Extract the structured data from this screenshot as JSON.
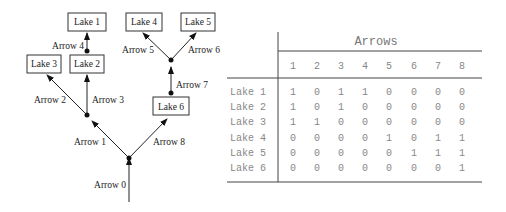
{
  "diagram": {
    "lakes": [
      "Lake 1",
      "Lake 2",
      "Lake 3",
      "Lake 4",
      "Lake 5",
      "Lake 6"
    ],
    "arrows": [
      "Arrow 0",
      "Arrow 1",
      "Arrow 2",
      "Arrow 3",
      "Arrow 4",
      "Arrow 5",
      "Arrow 6",
      "Arrow 7",
      "Arrow 8"
    ]
  },
  "table": {
    "title": "Arrows",
    "columns": [
      "1",
      "2",
      "3",
      "4",
      "5",
      "6",
      "7",
      "8"
    ],
    "rows": [
      {
        "label": "Lake 1",
        "values": [
          "1",
          "0",
          "1",
          "1",
          "0",
          "0",
          "0",
          "0"
        ]
      },
      {
        "label": "Lake 2",
        "values": [
          "1",
          "0",
          "1",
          "0",
          "0",
          "0",
          "0",
          "0"
        ]
      },
      {
        "label": "Lake 3",
        "values": [
          "1",
          "1",
          "0",
          "0",
          "0",
          "0",
          "0",
          "0"
        ]
      },
      {
        "label": "Lake 4",
        "values": [
          "0",
          "0",
          "0",
          "0",
          "1",
          "0",
          "1",
          "1"
        ]
      },
      {
        "label": "Lake 5",
        "values": [
          "0",
          "0",
          "0",
          "0",
          "0",
          "1",
          "1",
          "1"
        ]
      },
      {
        "label": "Lake 6",
        "values": [
          "0",
          "0",
          "0",
          "0",
          "0",
          "0",
          "0",
          "1"
        ]
      }
    ]
  }
}
